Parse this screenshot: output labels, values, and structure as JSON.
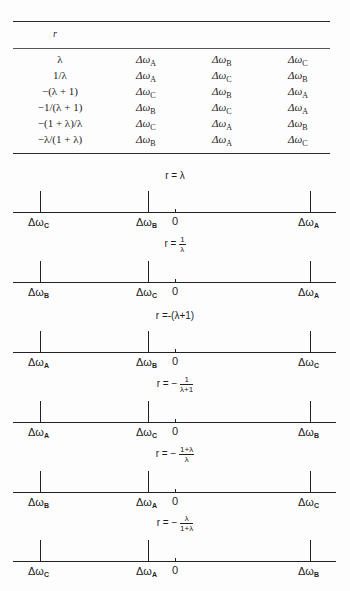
{
  "table": {
    "header": "r",
    "rows": [
      {
        "r": "λ",
        "col1": "A",
        "col2": "B",
        "col3": "C"
      },
      {
        "r": "1/λ",
        "col1": "A",
        "col2": "C",
        "col3": "B"
      },
      {
        "r": "−(λ + 1)",
        "col1": "C",
        "col2": "B",
        "col3": "A"
      },
      {
        "r": "−1/(λ + 1)",
        "col1": "B",
        "col2": "C",
        "col3": "A"
      },
      {
        "r": "−(1 + λ)/λ",
        "col1": "C",
        "col2": "A",
        "col3": "B"
      },
      {
        "r": "−λ/(1 + λ)",
        "col1": "B",
        "col2": "A",
        "col3": "C"
      }
    ],
    "symbol": "Δω"
  },
  "diagrams": [
    {
      "eq_prefix": "r = ",
      "eq_plain": "λ",
      "num": "",
      "den": "",
      "left": "C",
      "middle": "B",
      "right": "A",
      "zero": "0"
    },
    {
      "eq_prefix": "r = ",
      "eq_plain": "",
      "num": "1",
      "den": "λ",
      "left": "B",
      "middle": "C",
      "right": "A",
      "zero": "0"
    },
    {
      "eq_prefix": "r =",
      "eq_plain": "-(λ+1)",
      "num": "",
      "den": "",
      "left": "A",
      "middle": "B",
      "right": "C",
      "zero": "0"
    },
    {
      "eq_prefix": "r = − ",
      "eq_plain": "",
      "num": "1",
      "den": "λ+1",
      "left": "A",
      "middle": "C",
      "right": "B",
      "zero": "0"
    },
    {
      "eq_prefix": "r = − ",
      "eq_plain": "",
      "num": "1+λ",
      "den": "λ",
      "left": "B",
      "middle": "A",
      "right": "C",
      "zero": "0"
    },
    {
      "eq_prefix": "r = − ",
      "eq_plain": "",
      "num": "λ",
      "den": "1+λ",
      "left": "C",
      "middle": "A",
      "right": "B",
      "zero": "0"
    }
  ]
}
